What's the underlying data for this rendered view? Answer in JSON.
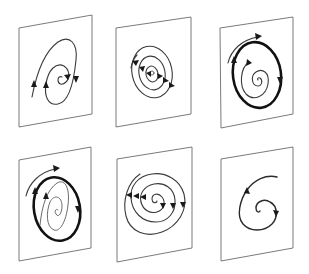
{
  "figure": {
    "layout": {
      "rows": 2,
      "cols": 3
    },
    "colors": {
      "background": "#ffffff",
      "plane_edge": "#6b6b6b",
      "trajectory": "#1a1a1a"
    },
    "panels": [
      {
        "id": 1,
        "row": 1,
        "col": 1,
        "kind": "unstable-spiral-open",
        "arrows": 4
      },
      {
        "id": 2,
        "row": 1,
        "col": 2,
        "kind": "nested-closed-orbits",
        "arrows": 6
      },
      {
        "id": 3,
        "row": 1,
        "col": 3,
        "kind": "stable-limit-cycle",
        "arrows": 3
      },
      {
        "id": 4,
        "row": 2,
        "col": 1,
        "kind": "stable-limit-cycle-elongated",
        "arrows": 3
      },
      {
        "id": 5,
        "row": 2,
        "col": 2,
        "kind": "stable-spiral-multi-arm",
        "arrows": 6
      },
      {
        "id": 6,
        "row": 2,
        "col": 3,
        "kind": "single-spiral-trajectory",
        "arrows": 2
      }
    ]
  }
}
